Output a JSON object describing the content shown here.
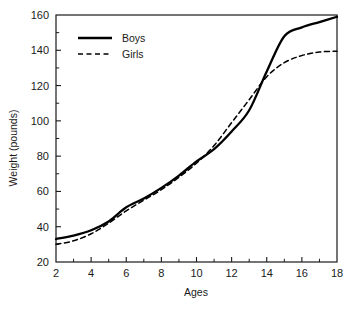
{
  "chart_data": {
    "type": "line",
    "title": "",
    "xlabel": "Ages",
    "ylabel": "Weight (pounds)",
    "xlim": [
      2,
      18
    ],
    "ylim": [
      20,
      160
    ],
    "x_major_ticks": [
      2,
      4,
      6,
      8,
      10,
      12,
      14,
      16,
      18
    ],
    "x_minor_ticks": [
      3,
      5,
      7,
      9,
      11,
      13,
      15,
      17
    ],
    "x_tick_labels": [
      "2",
      "4",
      "6",
      "8",
      "10",
      "12",
      "14",
      "16",
      "18"
    ],
    "y_major_ticks": [
      20,
      40,
      60,
      80,
      100,
      120,
      140,
      160
    ],
    "y_minor_ticks": [
      30,
      50,
      70,
      90,
      110,
      130,
      150
    ],
    "y_tick_labels": [
      "20",
      "40",
      "60",
      "80",
      "100",
      "120",
      "140",
      "160"
    ],
    "grid": false,
    "legend_position": "upper left inside",
    "x": [
      2,
      3,
      4,
      5,
      6,
      7,
      8,
      9,
      10,
      11,
      12,
      13,
      14,
      15,
      16,
      17,
      18
    ],
    "series": [
      {
        "name": "Boys",
        "style": "solid",
        "color": "#000000",
        "values": [
          33,
          35,
          38,
          43,
          51,
          56,
          62,
          69,
          77,
          84,
          94,
          106,
          128,
          148,
          153,
          156,
          159
        ]
      },
      {
        "name": "Girls",
        "style": "dashed",
        "color": "#000000",
        "values": [
          30,
          32,
          36,
          42,
          49,
          55,
          61,
          68,
          76,
          86,
          99,
          112,
          125,
          133,
          137,
          139,
          139.5
        ]
      }
    ],
    "annotations": {
      "first_crossing": "Curves cross near age 10.7 at about 80 pounds",
      "second_crossing": "Curves cross near age 13.6 at about 120 pounds"
    }
  },
  "legend": {
    "entries": [
      {
        "label": "Boys",
        "style": "solid"
      },
      {
        "label": "Girls",
        "style": "dashed"
      }
    ]
  },
  "axes": {
    "x_title": "Ages",
    "y_title": "Weight (pounds)"
  }
}
